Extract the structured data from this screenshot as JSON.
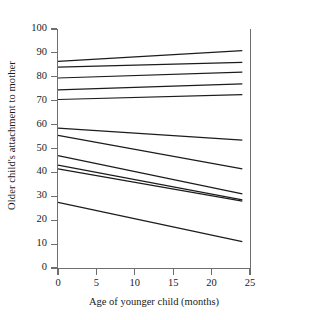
{
  "chart_data": {
    "type": "line",
    "title": "",
    "xlabel": "Age of younger child (months)",
    "ylabel": "Older child's attachment to mother",
    "xlim": [
      0,
      25
    ],
    "ylim": [
      0,
      100
    ],
    "xticks": [
      0,
      5,
      10,
      15,
      20,
      25
    ],
    "yticks": [
      0,
      10,
      20,
      30,
      40,
      50,
      60,
      70,
      80,
      90,
      100
    ],
    "grid": false,
    "legend": false,
    "line_color": "#1c1c1c",
    "axis_color": "#6e6e6e",
    "x": [
      0,
      24
    ],
    "series": [
      {
        "name": "line-1",
        "values": [
          86.5,
          91.0
        ]
      },
      {
        "name": "line-2",
        "values": [
          84.0,
          86.0
        ]
      },
      {
        "name": "line-3",
        "values": [
          79.5,
          82.0
        ]
      },
      {
        "name": "line-4",
        "values": [
          74.5,
          77.0
        ]
      },
      {
        "name": "line-5",
        "values": [
          70.5,
          72.5
        ]
      },
      {
        "name": "line-6",
        "values": [
          58.5,
          53.5
        ]
      },
      {
        "name": "line-7",
        "values": [
          55.5,
          41.5
        ]
      },
      {
        "name": "line-8",
        "values": [
          47.0,
          31.0
        ]
      },
      {
        "name": "line-9",
        "values": [
          43.0,
          28.5
        ]
      },
      {
        "name": "line-10",
        "values": [
          41.5,
          28.0
        ]
      },
      {
        "name": "line-11",
        "values": [
          27.5,
          11.0
        ]
      }
    ]
  },
  "axis": {
    "y_tick_labels": [
      "0",
      "10",
      "20",
      "30",
      "40",
      "50",
      "60",
      "70",
      "80",
      "90",
      "100"
    ],
    "x_tick_labels": [
      "0",
      "5",
      "10",
      "15",
      "20",
      "25"
    ],
    "y_title": "Older child's attachment to mother",
    "x_title": "Age of younger child (months)"
  }
}
